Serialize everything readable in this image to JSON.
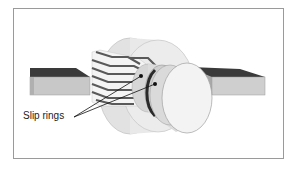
{
  "figure": {
    "type": "technical-illustration",
    "labels": [
      {
        "text": "Slip rings",
        "targets": 2
      }
    ]
  },
  "colors": {
    "frame_border": "#9a9a9a",
    "bar_top": "#3a3a3a",
    "bar_front": "#c8c8c8",
    "cylinder_light": "#e6e6e6",
    "lamination_stripe": "#5a5a5a",
    "ring_dark": "#2a2a2a",
    "disk_face": "#f2f2f2"
  }
}
